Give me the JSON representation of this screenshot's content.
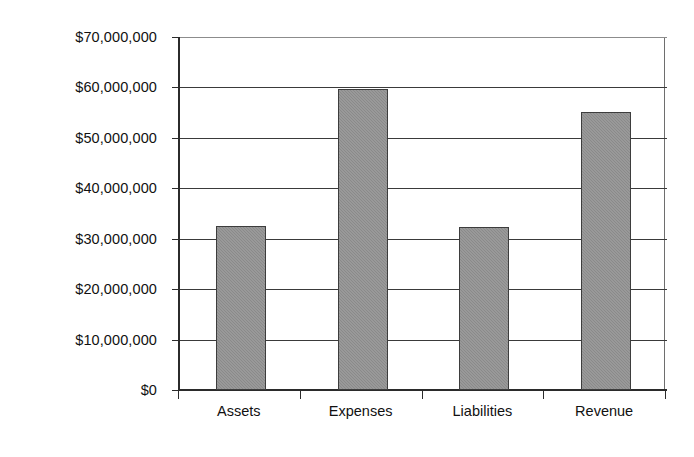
{
  "chart_data": {
    "type": "bar",
    "title": "",
    "subtitle": "",
    "xlabel": "",
    "ylabel": "",
    "categories": [
      "Assets",
      "Expenses",
      "Liabilities",
      "Revenue"
    ],
    "values": [
      32500000,
      59700000,
      32300000,
      55100000
    ],
    "series": [
      {
        "name": "Amount",
        "values": [
          32500000,
          59700000,
          32300000,
          55100000
        ]
      }
    ],
    "ylim": [
      0,
      70000000
    ],
    "ytick_values": [
      0,
      10000000,
      20000000,
      30000000,
      40000000,
      50000000,
      60000000,
      70000000
    ],
    "ytick_labels": [
      "$0",
      "$10,000,000",
      "$20,000,000",
      "$30,000,000",
      "$40,000,000",
      "$50,000,000",
      "$60,000,000",
      "$70,000,000"
    ],
    "grid": true,
    "grid_axis": "y",
    "legend": false,
    "legend_position": "none",
    "bar_color": "#8a8a8a",
    "bar_border_color": "#3d3d3d",
    "grid_color": "#3a3a3a",
    "axis_color": "#2b2b2b",
    "background_color": "#ffffff",
    "value_prefix": "$"
  }
}
